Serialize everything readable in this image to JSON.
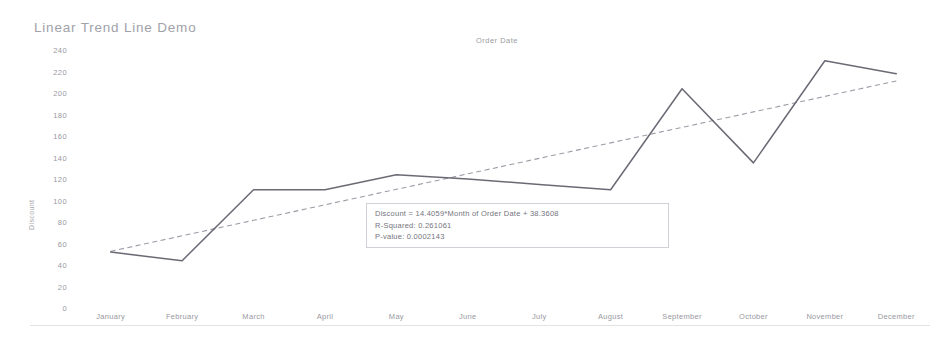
{
  "title": "Linear Trend Line Demo",
  "column_header": "Order Date",
  "axis": {
    "y_title": "Discount",
    "y_ticks": [
      "240",
      "220",
      "200",
      "180",
      "160",
      "140",
      "120",
      "100",
      "80",
      "60",
      "40",
      "20",
      "0"
    ],
    "x_ticks": [
      "January",
      "February",
      "March",
      "April",
      "May",
      "June",
      "July",
      "August",
      "September",
      "October",
      "November",
      "December"
    ]
  },
  "annotation": {
    "equation": "Discount = 14.4059*Month of Order Date + 38.3608",
    "r_squared": "R-Squared: 0.261061",
    "p_value": "P-value: 0.0002143"
  },
  "colors": {
    "data_line": "#5a5a66",
    "trend_line": "#8b8b96",
    "axis_text": "#8b8b93",
    "card_border": "#cfcfd6",
    "background": "#ffffff"
  },
  "chart_data": {
    "type": "line",
    "title": "Linear Trend Line Demo",
    "xlabel": "Order Date",
    "ylabel": "Discount",
    "ylim": [
      0,
      240
    ],
    "yticks": [
      0,
      20,
      40,
      60,
      80,
      100,
      120,
      140,
      160,
      180,
      200,
      220,
      240
    ],
    "grid": false,
    "legend": "none",
    "categories": [
      "January",
      "February",
      "March",
      "April",
      "May",
      "June",
      "July",
      "August",
      "September",
      "October",
      "November",
      "December"
    ],
    "series": [
      {
        "name": "Discount",
        "style": "solid",
        "color": "#5a5a66",
        "values": [
          52,
          44,
          110,
          110,
          124,
          120,
          115,
          110,
          204,
          135,
          230,
          218
        ]
      },
      {
        "name": "Trend Line",
        "style": "dashed",
        "color": "#8b8b96",
        "equation": "Discount = 14.4059*Month of Order Date + 38.3608",
        "slope": 14.4059,
        "intercept": 38.3608,
        "r_squared": 0.261061,
        "p_value": 0.0002143,
        "values": [
          52.77,
          67.17,
          81.58,
          95.98,
          110.39,
          124.79,
          139.2,
          153.61,
          168.01,
          182.42,
          196.82,
          211.23
        ]
      }
    ],
    "annotations": [
      "Discount = 14.4059*Month of Order Date + 38.3608",
      "R-Squared: 0.261061",
      "P-value: 0.0002143"
    ]
  }
}
